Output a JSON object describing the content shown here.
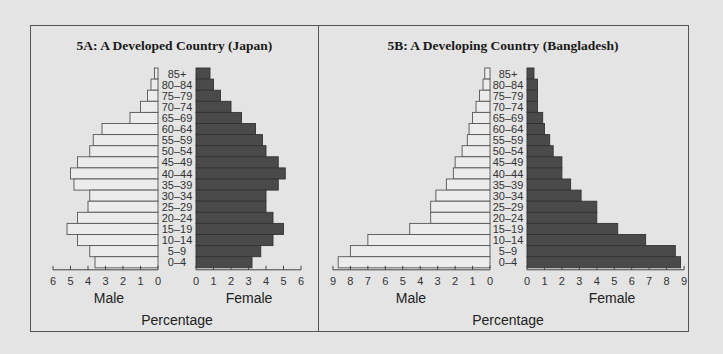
{
  "chart_data": [
    {
      "id": "5A",
      "type": "bar",
      "subtype": "population-pyramid",
      "title": "5A: A Developed Country (Japan)",
      "categories": [
        "85+",
        "80–84",
        "75–79",
        "70–74",
        "65–69",
        "60–64",
        "55–59",
        "50–54",
        "45–49",
        "40–44",
        "35–39",
        "30–34",
        "25–29",
        "20–24",
        "15–19",
        "10–14",
        "5–9",
        "0–4"
      ],
      "series": [
        {
          "name": "Male",
          "values": [
            0.2,
            0.4,
            0.6,
            1.0,
            1.6,
            3.2,
            3.7,
            3.9,
            4.6,
            5.0,
            4.8,
            3.9,
            4.0,
            4.6,
            5.2,
            4.6,
            3.9,
            3.6
          ],
          "color": "#ececec"
        },
        {
          "name": "Female",
          "values": [
            0.8,
            1.0,
            1.4,
            2.0,
            2.6,
            3.4,
            3.8,
            4.0,
            4.7,
            5.1,
            4.7,
            4.0,
            4.0,
            4.4,
            5.0,
            4.4,
            3.7,
            3.2
          ],
          "color": "#4a4a4a"
        }
      ],
      "xlabel": "Percentage",
      "male_label": "Male",
      "female_label": "Female",
      "xlim": [
        0,
        6
      ],
      "ticks": [
        0,
        1,
        2,
        3,
        4,
        5,
        6
      ],
      "grid": false
    },
    {
      "id": "5B",
      "type": "bar",
      "subtype": "population-pyramid",
      "title": "5B: A Developing Country (Bangladesh)",
      "categories": [
        "85+",
        "80–84",
        "75–79",
        "70–74",
        "65–69",
        "60–64",
        "55–59",
        "50–54",
        "45–49",
        "40–44",
        "35–39",
        "30–34",
        "25–29",
        "20–24",
        "15–19",
        "10–14",
        "5–9",
        "0–4"
      ],
      "series": [
        {
          "name": "Male",
          "values": [
            0.3,
            0.4,
            0.6,
            0.8,
            1.0,
            1.2,
            1.3,
            1.6,
            2.0,
            2.1,
            2.5,
            3.1,
            3.4,
            3.4,
            4.6,
            7.0,
            8.0,
            8.7
          ],
          "color": "#ececec"
        },
        {
          "name": "Female",
          "values": [
            0.4,
            0.6,
            0.6,
            0.6,
            0.9,
            1.0,
            1.3,
            1.5,
            2.0,
            2.0,
            2.5,
            3.1,
            4.0,
            4.0,
            5.2,
            6.8,
            8.5,
            8.8
          ],
          "color": "#4a4a4a"
        }
      ],
      "xlabel": "Percentage",
      "male_label": "Male",
      "female_label": "Female",
      "xlim": [
        0,
        9
      ],
      "ticks": [
        0,
        1,
        2,
        3,
        4,
        5,
        6,
        7,
        8,
        9
      ],
      "grid": false
    }
  ]
}
